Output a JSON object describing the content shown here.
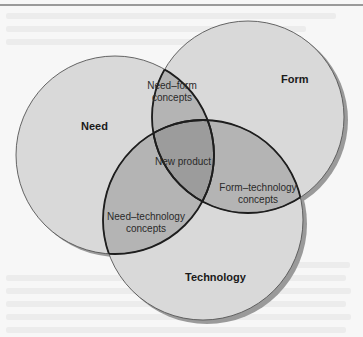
{
  "diagram": {
    "type": "venn",
    "sets": [
      {
        "id": "need",
        "label": "Need"
      },
      {
        "id": "form",
        "label": "Form"
      },
      {
        "id": "technology",
        "label": "Technology"
      }
    ],
    "intersections": {
      "need_form": [
        "Need–form",
        "concepts"
      ],
      "form_technology": [
        "Form–technology",
        "concepts"
      ],
      "need_technology": [
        "Need–technology",
        "concepts"
      ],
      "all": "New product"
    },
    "colors": {
      "single": "#d9d9d9",
      "double": "#b4b4b4",
      "triple": "#9c9c9c",
      "outline": "#1e1e1e",
      "shadow": "#9a9a9a",
      "background": "#f7f7f7"
    }
  }
}
